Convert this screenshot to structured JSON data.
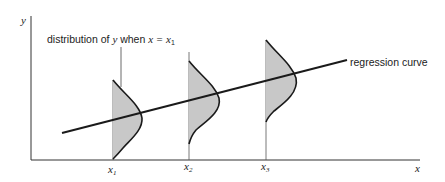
{
  "diagram": {
    "axes": {
      "x_label": "x",
      "y_label": "y"
    },
    "annotation": {
      "prefix": "distribution of ",
      "var": "y",
      "mid": " when ",
      "cond": "x = x",
      "sub": "1"
    },
    "regression_label": "regression curve",
    "x_ticks": [
      {
        "label": "x",
        "sub": "1"
      },
      {
        "label": "x",
        "sub": "2"
      },
      {
        "label": "x",
        "sub": "3"
      }
    ],
    "colors": {
      "line": "#1a1a1a",
      "fill": "#c8c8c8",
      "axis": "#333333"
    }
  }
}
